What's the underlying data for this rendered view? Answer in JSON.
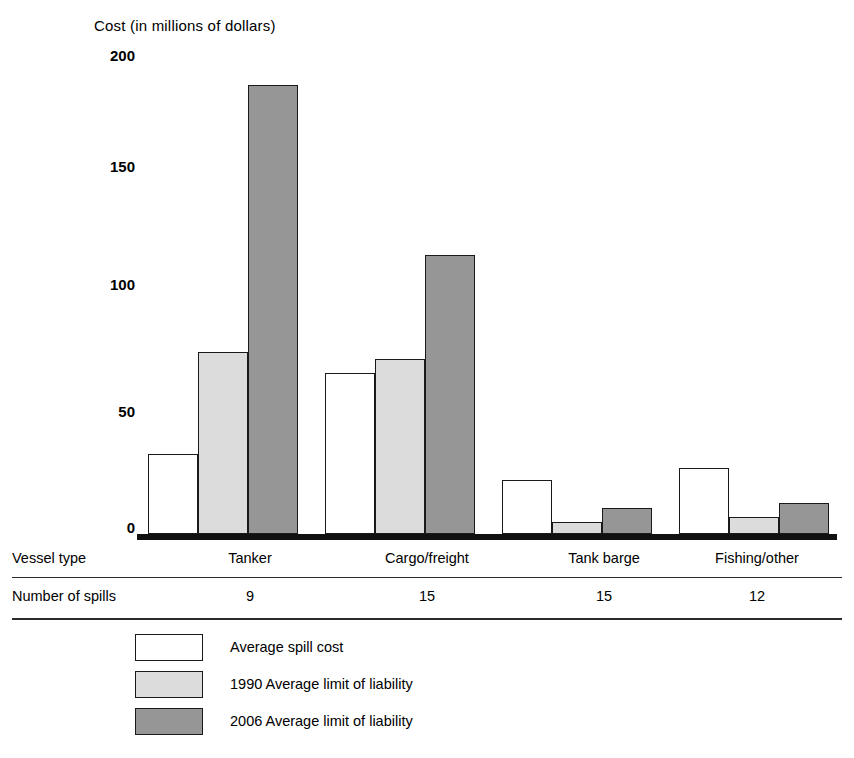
{
  "chart_data": {
    "type": "bar",
    "title": "Cost (in millions of dollars)",
    "xlabel": "",
    "ylabel": "Cost (in millions of dollars)",
    "ylim": [
      0,
      200
    ],
    "yticks": [
      200,
      150,
      100,
      50,
      0
    ],
    "grid": false,
    "legend_position": "bottom-left",
    "categories": [
      "Tanker",
      "Cargo/freight",
      "Tank barge",
      "Fishing/other"
    ],
    "series": [
      {
        "name": "Average spill cost",
        "color": "#ffffff",
        "values": [
          34,
          68,
          23,
          28
        ]
      },
      {
        "name": "1990 Average limit of liability",
        "color": "#dcdcdc",
        "values": [
          77,
          74,
          5,
          7
        ]
      },
      {
        "name": "2006 Average limit of liability",
        "color": "#969696",
        "values": [
          190,
          118,
          11,
          13
        ]
      }
    ],
    "annotations": {
      "row_label_vessel_type": "Vessel type",
      "row_label_number_of_spills": "Number of spills",
      "number_of_spills": [
        9,
        15,
        15,
        12
      ]
    }
  },
  "table": {
    "rows": [
      {
        "label": "Vessel type",
        "cells": [
          "Tanker",
          "Cargo/freight",
          "Tank barge",
          "Fishing/other"
        ]
      },
      {
        "label": "Number of spills",
        "cells": [
          "9",
          "15",
          "15",
          "12"
        ]
      }
    ]
  },
  "legend": {
    "items": [
      {
        "label": "Average spill cost",
        "swatch": "white-swatch"
      },
      {
        "label": "1990 Average limit of liability",
        "swatch": "light-gray-swatch"
      },
      {
        "label": "2006 Average limit of liability",
        "swatch": "dark-gray-swatch"
      }
    ]
  },
  "axis": {
    "ticks": [
      "200",
      "150",
      "100",
      "50",
      "0"
    ]
  }
}
